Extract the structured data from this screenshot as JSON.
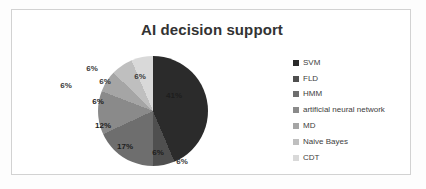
{
  "frame": {
    "border_color": "#d2d2d2",
    "background": "#ffffff"
  },
  "chart_data": {
    "type": "pie",
    "title": "AI decision support",
    "xlabel": "",
    "ylabel": "",
    "legend_position": "right",
    "grid": false,
    "categories": [
      "SVM",
      "FLD",
      "HMM",
      "artificial neural network",
      "MD",
      "Naive Bayes",
      "CDT"
    ],
    "values": [
      41,
      6,
      17,
      12,
      6,
      6,
      6
    ],
    "data_labels": [
      "41%",
      "6%",
      "17%",
      "12%",
      "6%",
      "6%",
      "6%"
    ],
    "colors": [
      "#2b2b2b",
      "#4f4f4f",
      "#6e6e6e",
      "#8a8a8a",
      "#a5a5a5",
      "#bfbfbf",
      "#d9d9d9"
    ],
    "legend": [
      {
        "label": "SVM",
        "color": "#2b2b2b",
        "swatch": "legend-swatch-icon"
      },
      {
        "label": "FLD",
        "color": "#4f4f4f",
        "swatch": "legend-swatch-icon"
      },
      {
        "label": "HMM",
        "color": "#6e6e6e",
        "swatch": "legend-swatch-icon"
      },
      {
        "label": "artificial neural network",
        "color": "#8a8a8a",
        "swatch": "legend-swatch-icon"
      },
      {
        "label": "MD",
        "color": "#a5a5a5",
        "swatch": "legend-swatch-icon"
      },
      {
        "label": "Naive Bayes",
        "color": "#bfbfbf",
        "swatch": "legend-swatch-icon"
      },
      {
        "label": "CDT",
        "color": "#d9d9d9",
        "swatch": "legend-swatch-icon"
      }
    ],
    "labels_layout": [
      {
        "text": "41%",
        "x": 132,
        "y": 47,
        "on_dark": true
      },
      {
        "text": "6%",
        "x": 116,
        "y": 104,
        "on_dark": true
      },
      {
        "text": "17%",
        "x": 83,
        "y": 98,
        "on_dark": true
      },
      {
        "text": "12%",
        "x": 61,
        "y": 77,
        "on_dark": true
      },
      {
        "text": "6%",
        "x": 56,
        "y": 53,
        "on_dark": true
      },
      {
        "text": "6%",
        "x": 63,
        "y": 33,
        "on_dark": false
      },
      {
        "text": "6%",
        "x": 98,
        "y": 28,
        "on_dark": false
      },
      {
        "text": "6%",
        "x": 24,
        "y": 37,
        "on_dark": false
      },
      {
        "text": "6%",
        "x": 50,
        "y": 20,
        "on_dark": false
      },
      {
        "text": "6%",
        "x": 140,
        "y": 113,
        "on_dark": false
      }
    ]
  }
}
